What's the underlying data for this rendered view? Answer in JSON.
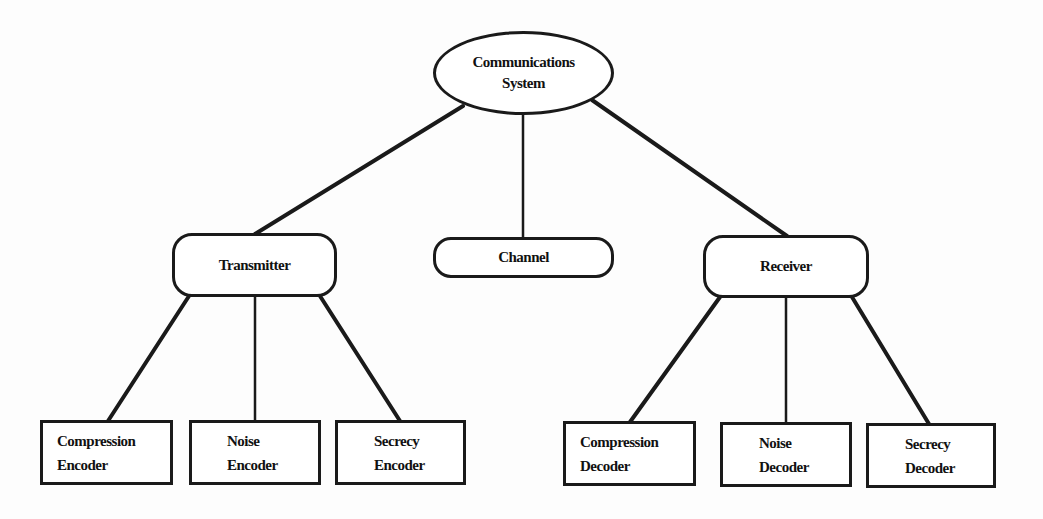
{
  "diagram": {
    "title": "",
    "root": {
      "id": "communications-system",
      "lines": [
        "Communications",
        "System"
      ]
    },
    "level1": [
      {
        "id": "transmitter",
        "label": "Transmitter"
      },
      {
        "id": "channel",
        "label": "Channel"
      },
      {
        "id": "receiver",
        "label": "Receiver"
      }
    ],
    "level2": [
      {
        "id": "compression-encoder",
        "parent": "transmitter",
        "lines": [
          "Compression",
          "Encoder"
        ]
      },
      {
        "id": "noise-encoder",
        "parent": "transmitter",
        "lines": [
          "Noise",
          "Encoder"
        ]
      },
      {
        "id": "secrecy-encoder",
        "parent": "transmitter",
        "lines": [
          "Secrecy",
          "Encoder"
        ]
      },
      {
        "id": "compression-decoder",
        "parent": "receiver",
        "lines": [
          "Compression",
          "Decoder"
        ]
      },
      {
        "id": "noise-decoder",
        "parent": "receiver",
        "lines": [
          "Noise",
          "Decoder"
        ]
      },
      {
        "id": "secrecy-decoder",
        "parent": "receiver",
        "lines": [
          "Secrecy",
          "Decoder"
        ]
      }
    ],
    "edges": [
      [
        "communications-system",
        "transmitter"
      ],
      [
        "communications-system",
        "channel"
      ],
      [
        "communications-system",
        "receiver"
      ],
      [
        "transmitter",
        "compression-encoder"
      ],
      [
        "transmitter",
        "noise-encoder"
      ],
      [
        "transmitter",
        "secrecy-encoder"
      ],
      [
        "receiver",
        "compression-decoder"
      ],
      [
        "receiver",
        "noise-decoder"
      ],
      [
        "receiver",
        "secrecy-decoder"
      ]
    ],
    "colors": {
      "stroke": "#1a1a1a",
      "background": "#ffffff"
    }
  }
}
